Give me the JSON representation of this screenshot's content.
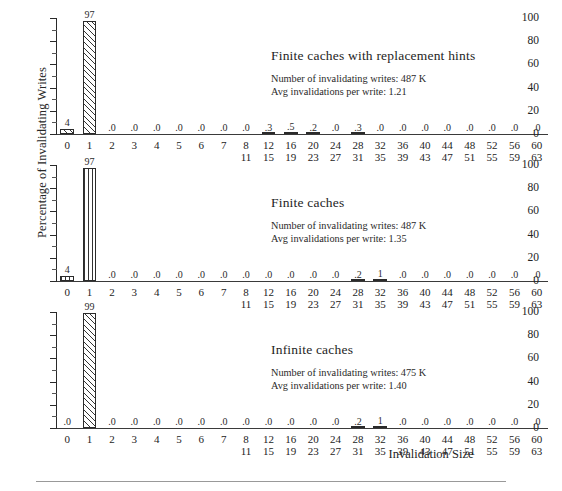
{
  "axes": {
    "ylabel": "Percentage of Invalidating Writes",
    "xlabel": "Invalidation Size",
    "yticks": [
      "0",
      "20",
      "40",
      "60",
      "80",
      "100"
    ]
  },
  "chart_data": {
    "type": "bar",
    "title": "",
    "xlabel": "Invalidation Size",
    "ylabel": "Percentage of Invalidating Writes",
    "ylim": [
      0,
      100
    ],
    "grid": false,
    "legend": "none",
    "categories": [
      "0",
      "1",
      "2",
      "3",
      "4",
      "5",
      "6",
      "7",
      "8-11",
      "12-15",
      "16-19",
      "20-23",
      "24-27",
      "28-31",
      "32-35",
      "36-39",
      "40-43",
      "44-47",
      "48-51",
      "52-55",
      "56-59",
      "60-63"
    ],
    "category_labels": [
      {
        "top": "0",
        "bottom": ""
      },
      {
        "top": "1",
        "bottom": ""
      },
      {
        "top": "2",
        "bottom": ""
      },
      {
        "top": "3",
        "bottom": ""
      },
      {
        "top": "4",
        "bottom": ""
      },
      {
        "top": "5",
        "bottom": ""
      },
      {
        "top": "6",
        "bottom": ""
      },
      {
        "top": "7",
        "bottom": ""
      },
      {
        "top": "8",
        "bottom": "11"
      },
      {
        "top": "12",
        "bottom": "15"
      },
      {
        "top": "16",
        "bottom": "19"
      },
      {
        "top": "20",
        "bottom": "23"
      },
      {
        "top": "24",
        "bottom": "27"
      },
      {
        "top": "28",
        "bottom": "31"
      },
      {
        "top": "32",
        "bottom": "35"
      },
      {
        "top": "36",
        "bottom": "39"
      },
      {
        "top": "40",
        "bottom": "43"
      },
      {
        "top": "44",
        "bottom": "47"
      },
      {
        "top": "48",
        "bottom": "51"
      },
      {
        "top": "52",
        "bottom": "55"
      },
      {
        "top": "56",
        "bottom": "59"
      },
      {
        "top": "60",
        "bottom": "63"
      }
    ],
    "panels": [
      {
        "id": "finite-caches-with-replacement-hints",
        "title": "Finite caches with replacement hints",
        "stat_writes": "Number of invalidating writes: 487 K",
        "stat_avg": "Avg invalidations per write: 1.21",
        "hatch": "diagonal",
        "values": [
          4,
          97,
          0,
          0,
          0,
          0,
          0,
          0,
          0,
          0.3,
          0.5,
          0.2,
          0,
          0.3,
          0,
          0,
          0,
          0,
          0,
          0,
          0,
          0
        ],
        "value_labels": [
          "4",
          "97",
          ".0",
          ".0",
          ".0",
          ".0",
          ".0",
          ".0",
          ".0",
          ".3",
          ".5",
          ".2",
          ".0",
          ".3",
          ".0",
          ".0",
          ".0",
          ".0",
          ".0",
          ".0",
          ".0",
          ".0"
        ]
      },
      {
        "id": "finite-caches",
        "title": "Finite caches",
        "stat_writes": "Number of invalidating writes: 487 K",
        "stat_avg": "Avg invalidations per write: 1.35",
        "hatch": "vertical",
        "values": [
          4,
          97,
          0,
          0,
          0,
          0,
          0,
          0,
          0,
          0,
          0,
          0,
          0,
          0.2,
          1,
          0,
          0,
          0,
          0,
          0,
          0,
          0
        ],
        "value_labels": [
          "4",
          "97",
          ".0",
          ".0",
          ".0",
          ".0",
          ".0",
          ".0",
          ".0",
          ".0",
          ".0",
          ".0",
          ".0",
          ".2",
          "1",
          ".0",
          ".0",
          ".0",
          ".0",
          ".0",
          ".0",
          ".0"
        ]
      },
      {
        "id": "infinite-caches",
        "title": "Infinite caches",
        "stat_writes": "Number of invalidating writes: 475 K",
        "stat_avg": "Avg invalidations per write: 1.40",
        "hatch": "diagonal",
        "values": [
          0,
          99,
          0,
          0,
          0,
          0,
          0,
          0,
          0,
          0,
          0,
          0,
          0,
          0.2,
          1,
          0,
          0,
          0,
          0,
          0,
          0,
          0
        ],
        "value_labels": [
          ".0",
          "99",
          ".0",
          ".0",
          ".0",
          ".0",
          ".0",
          ".0",
          ".0",
          ".0",
          ".0",
          ".0",
          ".0",
          ".2",
          "1",
          ".0",
          ".0",
          ".0",
          ".0",
          ".0",
          ".0",
          ".0"
        ]
      }
    ]
  }
}
